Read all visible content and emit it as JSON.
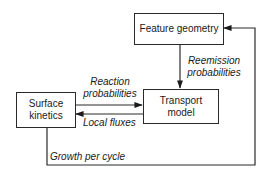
{
  "nodes": {
    "feature_geometry": {
      "label": "Feature geometry"
    },
    "transport_model": {
      "label_line1": "Transport",
      "label_line2": "model"
    },
    "surface_kinetics": {
      "label_line1": "Surface",
      "label_line2": "kinetics"
    }
  },
  "edges": {
    "reemission": {
      "line1": "Reemission",
      "line2": "probabilities"
    },
    "reaction": {
      "line1": "Reaction",
      "line2": "probabilities"
    },
    "local_fluxes": {
      "label": "Local fluxes"
    },
    "growth": {
      "label": "Growth per cycle"
    }
  }
}
